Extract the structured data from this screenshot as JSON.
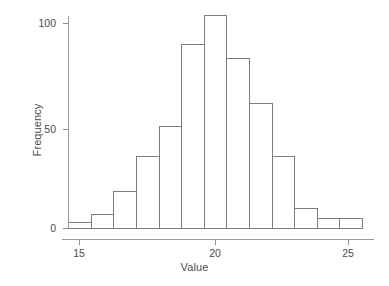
{
  "chart_data": {
    "type": "bar",
    "title": "",
    "subtitle": "",
    "xlabel": "Value",
    "ylabel": "Frequency",
    "xlim": [
      14.6,
      25.6
    ],
    "ylim": [
      0,
      108
    ],
    "xticks": [
      15,
      20,
      25
    ],
    "xtick_labels": [
      "15",
      "20",
      "25"
    ],
    "yticks": [
      0,
      50,
      100
    ],
    "ytick_labels": [
      "0",
      "50",
      "100"
    ],
    "grid": false,
    "legend": null,
    "bin_edges": [
      14.6,
      15.44,
      16.28,
      17.12,
      17.96,
      18.8,
      19.64,
      20.48,
      21.32,
      22.16,
      23.0,
      23.84,
      24.68,
      25.52
    ],
    "bin_centers": [
      15.02,
      15.86,
      16.7,
      17.54,
      18.38,
      19.22,
      20.06,
      20.9,
      21.74,
      22.58,
      23.42,
      24.26,
      25.1
    ],
    "values": [
      3,
      7,
      18,
      35,
      50,
      90,
      104,
      83,
      61,
      35,
      10,
      5,
      5
    ],
    "bar_style": {
      "facecolor": "#ffffff",
      "edgecolor": "#7d7d7d",
      "linewidth": 1
    },
    "axis_color": "#9a9a9a",
    "text_color": "#4d4d4d",
    "background": "#ffffff"
  },
  "geometry": {
    "x_pixel_at_15": 79,
    "x_pixel_at_20": 215,
    "x_pixel_at_25": 348,
    "y_pixel_at_0": 228,
    "y_pixel_at_50": 129,
    "y_pixel_at_100": 23,
    "baseline_y": 228
  }
}
